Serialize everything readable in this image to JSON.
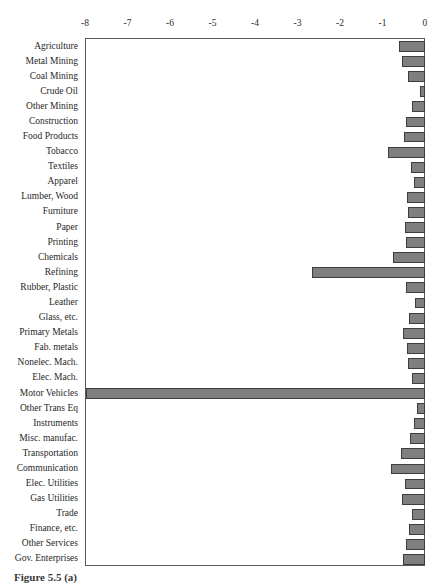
{
  "caption": "Figure 5.5 (a)",
  "chart_data": {
    "type": "bar",
    "orientation": "horizontal",
    "title": "",
    "xlabel": "",
    "ylabel": "",
    "xlim": [
      -8,
      0
    ],
    "ylim": null,
    "grid": false,
    "legend": null,
    "bar_color": "#7f7f7f",
    "bar_edge_color": "#3d3d3d",
    "axis_color": "#5a5a5a",
    "background": "#ffffff",
    "xticks": [
      -8,
      -7,
      -6,
      -5,
      -4,
      -3,
      -2,
      -1,
      0
    ],
    "xtick_labels": [
      "-8",
      "-7",
      "-6",
      "-5",
      "-4",
      "-3",
      "-2",
      "-1",
      "0"
    ],
    "categories": [
      "Agriculture",
      "Metal Mining",
      "Coal Mining",
      "Crude Oil",
      "Other Mining",
      "Construction",
      "Food Products",
      "Tobacco",
      "Textiles",
      "Apparel",
      "Lumber, Wood",
      "Furniture",
      "Paper",
      "Printing",
      "Chemicals",
      "Refining",
      "Rubber, Plastic",
      "Leather",
      "Glass, etc.",
      "Primary Metals",
      "Fab. metals",
      "Nonelec. Mach.",
      "Elec. Mach.",
      "Motor Vehicles",
      "Other Trans Eq",
      "Instruments",
      "Misc. manufac.",
      "Transportation",
      "Communication",
      "Elec. Utilities",
      "Gas Utilities",
      "Trade",
      "Finance, etc.",
      "Other Services",
      "Gov. Enterprises"
    ],
    "values": [
      -0.62,
      -0.55,
      -0.4,
      -0.12,
      -0.31,
      -0.45,
      -0.5,
      -0.87,
      -0.33,
      -0.26,
      -0.43,
      -0.4,
      -0.48,
      -0.45,
      -0.76,
      -2.67,
      -0.45,
      -0.24,
      -0.38,
      -0.52,
      -0.43,
      -0.4,
      -0.31,
      -7.98,
      -0.19,
      -0.26,
      -0.36,
      -0.57,
      -0.79,
      -0.48,
      -0.55,
      -0.31,
      -0.38,
      -0.45,
      -0.52
    ]
  }
}
